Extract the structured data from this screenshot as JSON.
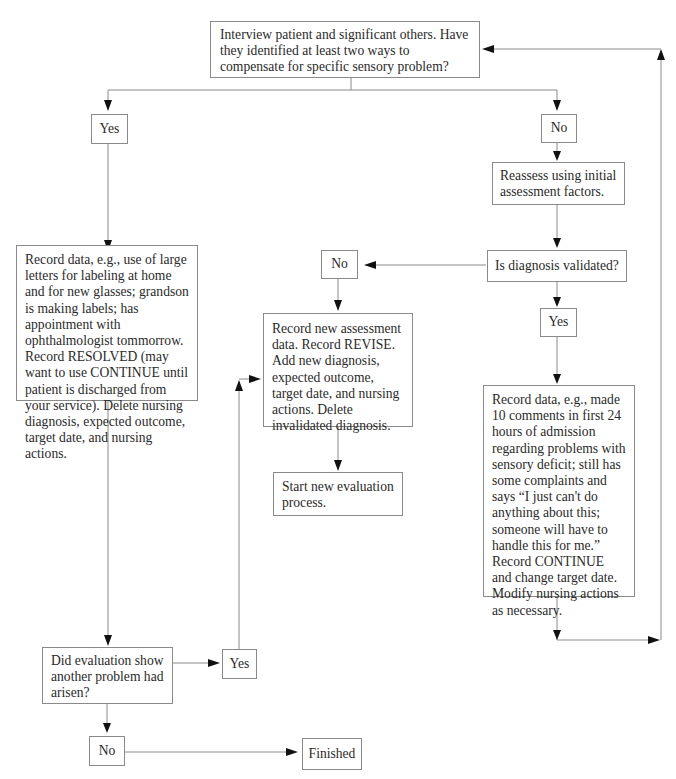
{
  "flowchart": {
    "start": {
      "text": "Interview patient and significant others. Have they identified at least two ways to compensate for specific sensory problem?"
    },
    "yes_branch": {
      "label": "Yes",
      "record": "Record data, e.g., use of large letters for labeling at home and for new glasses; grandson is making labels; has appointment with ophthalmologist tommorrow. Record RESOLVED (may want to use CONTINUE until patient is discharged from your service). Delete nursing diagnosis, expected outcome, target date, and nursing actions.",
      "question": "Did evaluation show another problem had arisen?",
      "question_yes": "Yes",
      "question_no": "No",
      "finished": "Finished"
    },
    "no_branch": {
      "label": "No",
      "reassess": "Reassess using initial assessment factors.",
      "validated_question": "Is diagnosis validated?",
      "validated_no": "No",
      "revise": "Record new assessment data. Record REVISE. Add new diagnosis, expected outcome, target date, and nursing actions. Delete invalidated diagnosis.",
      "new_eval": "Start new evaluation process.",
      "validated_yes": "Yes",
      "continue": "Record data, e.g., made 10 comments in first 24 hours of admission regarding problems with sensory deficit; still has some complaints and says “I just can't do anything about this; someone will have to handle this for me.” Record CONTINUE and change target date. Modify nursing actions as necessary."
    }
  }
}
